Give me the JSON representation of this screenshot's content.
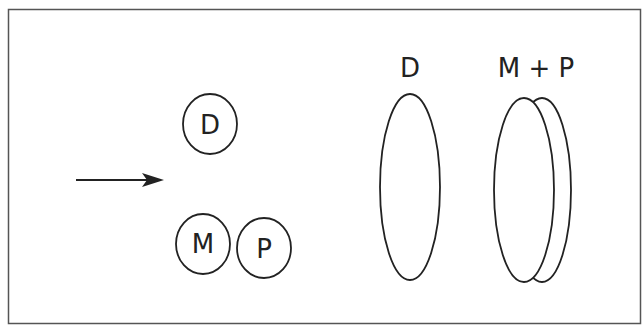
{
  "diagram": {
    "frame": {
      "stroke": "#555555"
    },
    "arrow": {
      "direction": "right",
      "color": "#222222"
    },
    "left_group": {
      "top_circle": {
        "label": "D"
      },
      "bottom_circles": [
        {
          "label": "M"
        },
        {
          "label": "P"
        }
      ]
    },
    "right_group": {
      "single_ellipse": {
        "label": "D"
      },
      "paired_ellipses": {
        "label": "M + P"
      }
    },
    "colors": {
      "line": "#222222",
      "background": "#ffffff"
    }
  }
}
